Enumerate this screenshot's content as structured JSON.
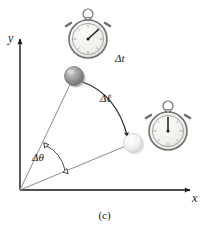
{
  "figure": {
    "caption": "(c)",
    "background_color": "#ffffff",
    "ink_color": "#161616"
  },
  "axes": {
    "x_label": "x",
    "y_label": "y",
    "origin": {
      "x": 20,
      "y": 190
    },
    "x_axis_end": {
      "x": 193,
      "y": 190
    },
    "y_axis_end": {
      "x": 20,
      "y": 36
    }
  },
  "labels": {
    "delta_t": "Δt",
    "delta_l": "Δℓ",
    "delta_theta": "Δθ"
  },
  "bodies": [
    {
      "name": "pendulum-bob-initial",
      "shade": "dark",
      "fill_color": "#9a9a9a",
      "cx": 74,
      "cy": 76,
      "r": 9.5
    },
    {
      "name": "pendulum-bob-final",
      "shade": "light",
      "fill_color": "#ededed",
      "cx": 133,
      "cy": 143,
      "r": 9.5
    }
  ],
  "stopwatches": [
    {
      "name": "stopwatch-start",
      "cx": 88,
      "cy": 39,
      "r": 19,
      "hand_angle_deg": 50,
      "face_color": "#f2f0ec",
      "rim_color": "#7d7d7d"
    },
    {
      "name": "stopwatch-end",
      "cx": 168,
      "cy": 131,
      "r": 19,
      "hand_angle_deg": 0,
      "face_color": "#f2f0ec",
      "rim_color": "#7d7d7d"
    }
  ],
  "radii": [
    {
      "name": "radius-initial",
      "x1": 20,
      "y1": 190,
      "x2": 74,
      "y2": 76
    },
    {
      "name": "radius-final",
      "x1": 20,
      "y1": 190,
      "x2": 133,
      "y2": 143
    }
  ],
  "arc_displacement": {
    "name": "arc-delta-l",
    "from": {
      "x": 81,
      "y": 81
    },
    "to": {
      "x": 128,
      "y": 137
    },
    "control": {
      "x": 118,
      "y": 95
    }
  },
  "arc_angle": {
    "name": "arc-delta-theta",
    "from": {
      "x": 45,
      "y": 146
    },
    "to": {
      "x": 66,
      "y": 172
    },
    "control": {
      "x": 60,
      "y": 152
    }
  }
}
